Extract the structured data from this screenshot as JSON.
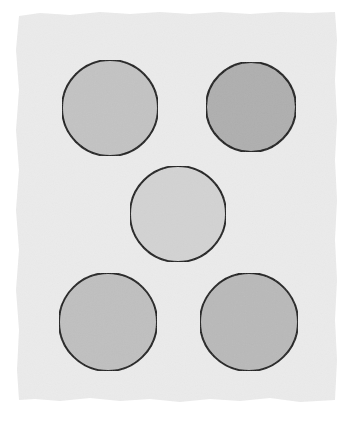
{
  "figure": {
    "background": "#ffffff",
    "paper": {
      "color": "#ebebeb",
      "outline_points": "19,16 40,13 70,15 100,12 130,14 160,12 190,14 220,12 250,14 280,12 310,13 335,12 337,40 335,80 337,120 335,160 337,200 335,240 337,280 335,320 337,360 335,400 300,402 270,398 240,401 210,399 180,402 150,399 120,401 90,398 60,401 35,399 19,400 17,370 19,330 16,290 19,250 16,210 19,170 16,130 19,90 16,50"
    },
    "stroke_color": "#1c1c1c",
    "circles": [
      {
        "id": "top-left",
        "cx": 110,
        "cy": 108,
        "r": 48,
        "fill": "#c3c3c3"
      },
      {
        "id": "top-right",
        "cx": 251,
        "cy": 107,
        "r": 45,
        "fill": "#afafaf"
      },
      {
        "id": "middle",
        "cx": 178,
        "cy": 214,
        "r": 48,
        "fill": "#d3d3d3"
      },
      {
        "id": "bottom-left",
        "cx": 108,
        "cy": 322,
        "r": 49,
        "fill": "#c0c0c0"
      },
      {
        "id": "bottom-right",
        "cx": 249,
        "cy": 322,
        "r": 49,
        "fill": "#b9b9b9"
      }
    ]
  }
}
